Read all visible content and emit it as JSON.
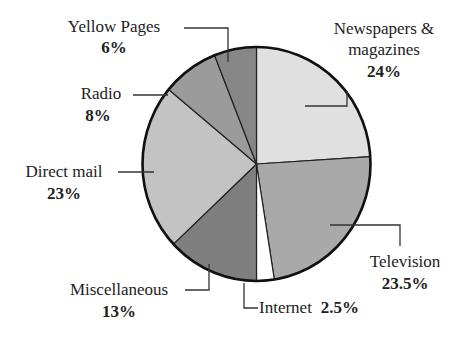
{
  "chart_data": {
    "type": "pie",
    "title": "",
    "start_angle_deg": 0,
    "direction": "clockwise",
    "slices": [
      {
        "label": "Newspapers & magazines",
        "value": 24,
        "display": "24%",
        "color": "#e0e0e0"
      },
      {
        "label": "Television",
        "value": 23.5,
        "display": "23.5%",
        "color": "#a9a9a9"
      },
      {
        "label": "Internet",
        "value": 2.5,
        "display": "2.5%",
        "color": "#ffffff"
      },
      {
        "label": "Miscellaneous",
        "value": 13,
        "display": "13%",
        "color": "#7f7f7f"
      },
      {
        "label": "Direct mail",
        "value": 23,
        "display": "23%",
        "color": "#c3c3c3"
      },
      {
        "label": "Radio",
        "value": 8,
        "display": "8%",
        "color": "#9b9b9b"
      },
      {
        "label": "Yellow Pages",
        "value": 6,
        "display": "6%",
        "color": "#878787"
      }
    ]
  },
  "labels": {
    "newspapers": {
      "line1": "Newspapers &",
      "line2": "magazines",
      "pct": "24%"
    },
    "television": {
      "line1": "Television",
      "pct": "23.5%"
    },
    "internet": {
      "line1": "Internet",
      "pct": "2.5%"
    },
    "miscellaneous": {
      "line1": "Miscellaneous",
      "pct": "13%"
    },
    "direct_mail": {
      "line1": "Direct mail",
      "pct": "23%"
    },
    "radio": {
      "line1": "Radio",
      "pct": "8%"
    },
    "yellow_pages": {
      "line1": "Yellow Pages",
      "pct": "6%"
    }
  }
}
